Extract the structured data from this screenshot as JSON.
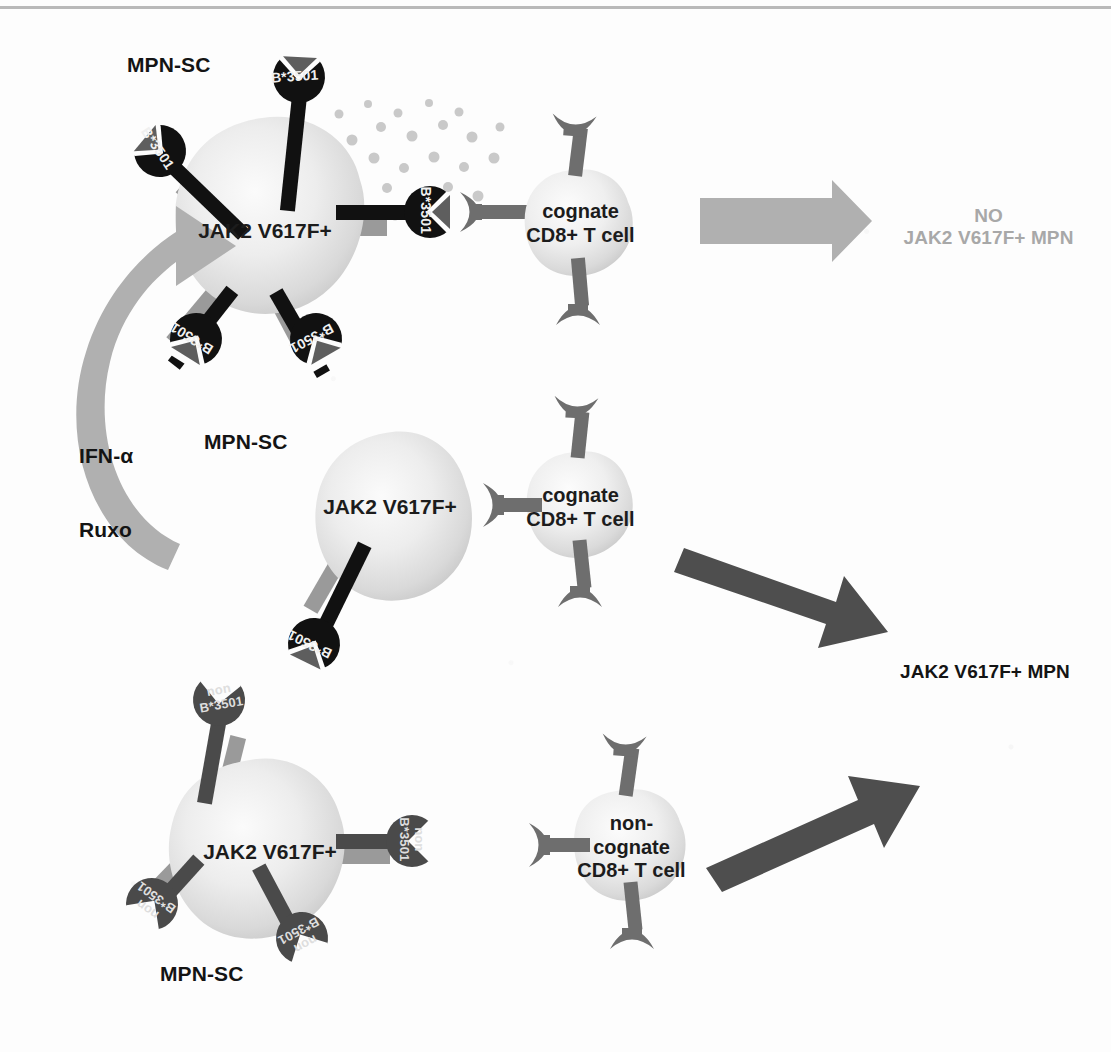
{
  "figure": {
    "top_rule_color": "#b9b9b9",
    "background": "#fdfdfd"
  },
  "palette": {
    "mhc_cognate": "#111111",
    "mhc_noncognate": "#4a4a4a",
    "stalk_gray": "#9a9a9a",
    "cell_fill_light": "#f2f2f2",
    "cell_fill_mid": "#cfcfcf",
    "tcr_gray": "#6e6e6e",
    "arrow_gray": "#b0b0b0",
    "arrow_dark": "#4e4e4e",
    "text_dark": "#141414",
    "text_gray": "#a8a8a8",
    "cytokine_dot": "#c4c4c4"
  },
  "rows": {
    "top": {
      "mpn_sc_label": "MPN-SC",
      "cell_label": "JAK2 V617F+",
      "mhc_label": "B*3501",
      "mhc_count": 5,
      "tcell_label": "cognate\nCD8+ T cell",
      "outcome": "NO\nJAK2 V617F+ MPN",
      "arrow_style": "gray"
    },
    "middle": {
      "mpn_sc_label": "MPN-SC",
      "cell_label": "JAK2 V617F+",
      "mhc_label": "B*3501",
      "mhc_count": 1,
      "tcell_label": "cognate\nCD8+ T cell",
      "arrow_style": "dark"
    },
    "bottom": {
      "mpn_sc_label": "MPN-SC",
      "cell_label": "JAK2 V617F+",
      "mhc_label": "non\nB*3501",
      "mhc_count": 4,
      "tcell_label": "non-\ncognate\nCD8+ T cell",
      "arrow_style": "dark"
    }
  },
  "treatment": {
    "line1": "IFN-α",
    "line2": "Ruxo"
  },
  "outcomes": {
    "no_mpn": "NO\nJAK2 V617F+ MPN",
    "no_mpn_line1": "NO",
    "no_mpn_line2": "JAK2 V617F+ MPN",
    "mpn": "JAK2 V617F+ MPN"
  }
}
